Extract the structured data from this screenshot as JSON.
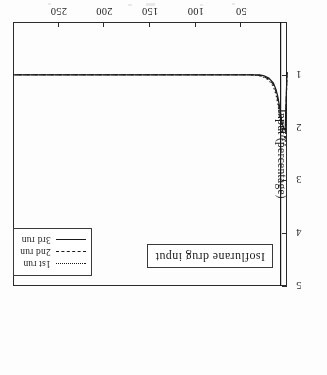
{
  "figure": {
    "annotation": "Isoflurane drug input",
    "xlabel": "Time (min)",
    "ylabel": "Input (percentage)",
    "xticks": [
      "50",
      "100",
      "150",
      "200",
      "250"
    ],
    "yticks": [
      "1",
      "2",
      "3",
      "4",
      "5"
    ],
    "legend": [
      {
        "label": "1st run",
        "style": "dotted"
      },
      {
        "label": "2nd run",
        "style": "dashed"
      },
      {
        "label": "3rd run",
        "style": "solid"
      }
    ]
  },
  "chart_data": {
    "type": "line",
    "title": "Isoflurane drug input",
    "xlabel": "Time (min)",
    "ylabel": "Input (percentage)",
    "xlim": [
      0,
      300
    ],
    "ylim": [
      0,
      5
    ],
    "xticks": [
      50,
      100,
      150,
      200,
      250
    ],
    "yticks": [
      1,
      2,
      3,
      4,
      5
    ],
    "grid": false,
    "legend_position": "upper right",
    "annotations": [
      {
        "text": "Isoflurane drug input",
        "boxed": true,
        "position": "upper left"
      }
    ],
    "series": [
      {
        "name": "1st run",
        "style": "dotted",
        "x": [
          0,
          2,
          4,
          6,
          8,
          10,
          12,
          15,
          20,
          25,
          30,
          40,
          50,
          60,
          80,
          100,
          120,
          140,
          160,
          180,
          200,
          220,
          240,
          260,
          280,
          300
        ],
        "y": [
          0.95,
          2.35,
          2.3,
          2.1,
          1.8,
          1.55,
          1.38,
          1.22,
          1.1,
          1.05,
          1.02,
          1.0,
          1.0,
          1.0,
          1.0,
          1.0,
          1.0,
          1.0,
          1.0,
          1.0,
          1.0,
          1.0,
          1.0,
          1.0,
          1.0,
          1.0
        ]
      },
      {
        "name": "2nd run",
        "style": "dashed",
        "x": [
          0,
          2,
          4,
          6,
          8,
          10,
          12,
          15,
          20,
          25,
          30,
          40,
          50,
          60,
          80,
          100,
          120,
          140,
          160,
          180,
          200,
          220,
          240,
          260,
          280,
          300
        ],
        "y": [
          0.95,
          2.2,
          2.15,
          1.95,
          1.7,
          1.48,
          1.32,
          1.18,
          1.08,
          1.04,
          1.01,
          1.0,
          1.0,
          1.0,
          1.0,
          1.0,
          1.0,
          1.0,
          1.0,
          1.0,
          1.0,
          1.0,
          1.0,
          1.0,
          1.0,
          1.0
        ]
      },
      {
        "name": "3rd run",
        "style": "solid",
        "x": [
          0,
          2,
          4,
          6,
          8,
          10,
          12,
          15,
          20,
          25,
          30,
          40,
          50,
          60,
          80,
          100,
          120,
          140,
          160,
          180,
          200,
          220,
          240,
          260,
          280,
          300
        ],
        "y": [
          0.95,
          2.05,
          2.0,
          1.85,
          1.62,
          1.42,
          1.28,
          1.15,
          1.06,
          1.02,
          1.0,
          1.0,
          1.0,
          1.0,
          1.0,
          1.0,
          1.0,
          1.0,
          1.0,
          1.0,
          1.0,
          1.0,
          1.0,
          1.0,
          1.0,
          1.0
        ]
      }
    ],
    "vertical_rule": {
      "x": 7,
      "y_from": 0,
      "y_to": 5,
      "style": "solid"
    }
  }
}
